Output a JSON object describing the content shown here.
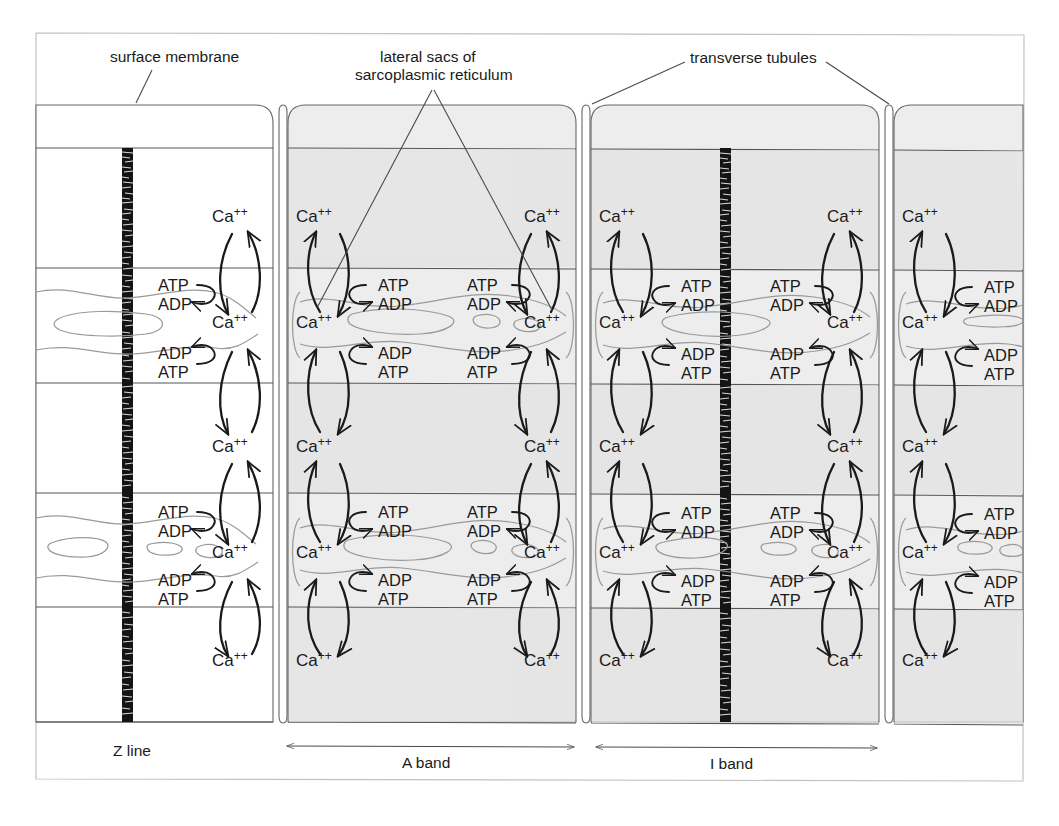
{
  "figure": {
    "title_labels": {
      "surface_membrane": "surface membrane",
      "lateral_sacs_line1": "lateral sacs of",
      "lateral_sacs_line2": "sarcoplasmic reticulum",
      "transverse_tubules": "transverse tubules"
    },
    "bottom_labels": {
      "z_line": "Z line",
      "a_band": "A band",
      "i_band": "I band"
    },
    "ion_label": "Ca",
    "ion_charge": "++",
    "nucleotides": {
      "atp": "ATP",
      "adp": "ADP"
    },
    "colors": {
      "ink": "#1a1a1a",
      "membrane_line": "#555555",
      "sr_membrane": "#8a8a8a",
      "shade": "#ececec",
      "frame": "#b9b9b9",
      "background": "#ffffff"
    },
    "structure": {
      "columns": [
        {
          "name": "myofibril-column-1",
          "kind": "myofibril",
          "x": 40,
          "width": 233,
          "shaded": false
        },
        {
          "name": "t-tubule-column-1",
          "kind": "transverse-tubule",
          "x": 279,
          "width": 8,
          "shaded": false
        },
        {
          "name": "myofibril-column-2",
          "kind": "myofibril",
          "x": 288,
          "width": 288,
          "shaded": true
        },
        {
          "name": "t-tubule-column-2",
          "kind": "transverse-tubule",
          "x": 582,
          "width": 8,
          "shaded": false
        },
        {
          "name": "myofibril-column-3",
          "kind": "myofibril",
          "x": 591,
          "width": 288,
          "shaded": true
        },
        {
          "name": "t-tubule-column-3",
          "kind": "transverse-tubule",
          "x": 885,
          "width": 8,
          "shaded": false
        },
        {
          "name": "myofibril-column-4",
          "kind": "myofibril",
          "x": 894,
          "width": 130,
          "shaded": true
        }
      ],
      "band_boundaries_y": [
        148,
        268,
        383,
        493,
        607,
        722
      ],
      "z_line_positions_x": [
        125,
        723
      ],
      "sr_band_rows_y": [
        268,
        493
      ],
      "ca_rows_y": [
        217,
        322,
        447,
        552,
        660
      ]
    },
    "transport_units": [
      {
        "name": "unit-col1-right",
        "x": 232,
        "outward": true
      },
      {
        "name": "unit-col2-left",
        "x": 316,
        "outward": false
      },
      {
        "name": "unit-col2-right",
        "x": 547,
        "outward": true
      },
      {
        "name": "unit-col3-left",
        "x": 619,
        "outward": false
      },
      {
        "name": "unit-col3-right",
        "x": 850,
        "outward": true
      },
      {
        "name": "unit-col4-left",
        "x": 922,
        "outward": false
      }
    ]
  }
}
